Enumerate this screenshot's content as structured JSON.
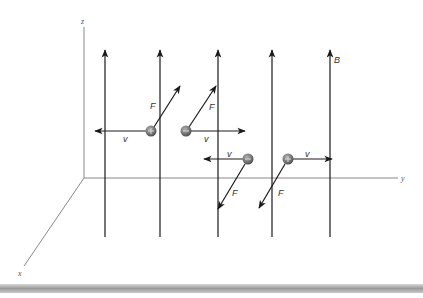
{
  "diagram": {
    "axes": {
      "z_label": "z",
      "y_label": "y",
      "x_label": "x"
    },
    "field": {
      "label": "B",
      "direction": "+z",
      "line_count": 5
    },
    "particles": [
      {
        "charge": "+",
        "velocity_label": "v",
        "velocity_direction": "-y",
        "force_label": "F",
        "force_direction": "up-right"
      },
      {
        "charge": "−",
        "velocity_label": "v",
        "velocity_direction": "+y",
        "force_label": "F",
        "force_direction": "up-right"
      },
      {
        "charge": "−",
        "velocity_label": "v",
        "velocity_direction": "-y",
        "force_label": "F",
        "force_direction": "down-left"
      },
      {
        "charge": "+",
        "velocity_label": "v",
        "velocity_direction": "+y",
        "force_label": "F",
        "force_direction": "down-left"
      }
    ],
    "colors": {
      "line": "#1a1a1a",
      "axis": "#888888",
      "particle": "#7a7a7a"
    }
  }
}
